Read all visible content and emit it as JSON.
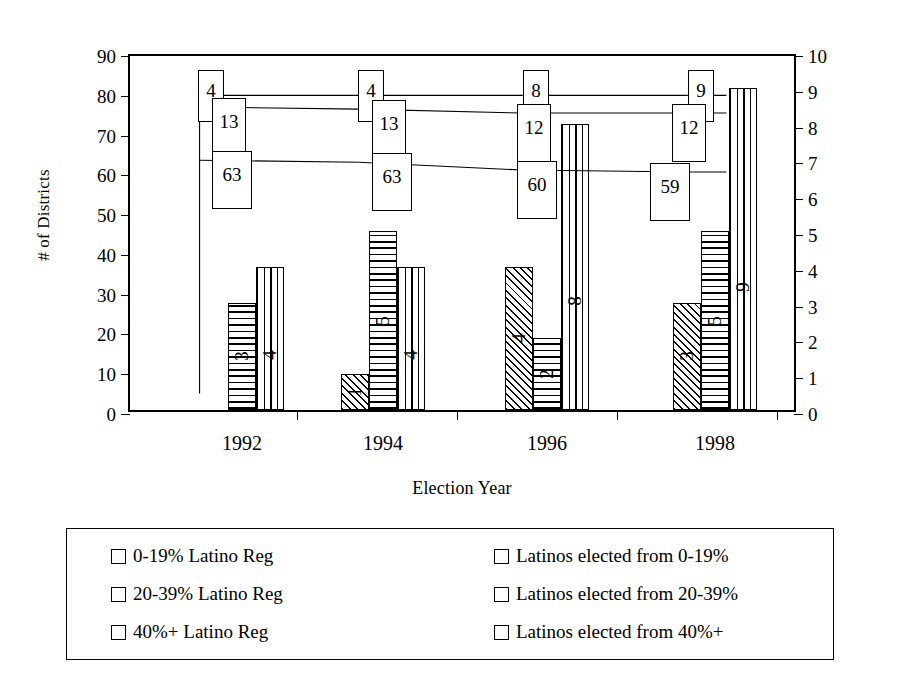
{
  "chart_data": {
    "type": "bar",
    "title": "",
    "subtitle": "",
    "xlabel": "Election Year",
    "ylabel": "# of Districts",
    "y2label": "# of Latino Elected Officials",
    "categories": [
      "1992",
      "1994",
      "1996",
      "1998"
    ],
    "ylim": [
      0,
      90
    ],
    "yticks": [
      0,
      10,
      20,
      30,
      40,
      50,
      60,
      70,
      80,
      90
    ],
    "y2lim": [
      0,
      10
    ],
    "y2ticks": [
      0,
      1,
      2,
      3,
      4,
      5,
      6,
      7,
      8,
      9,
      10
    ],
    "grid": false,
    "legend_position": "bottom",
    "series": [
      {
        "name": "0-19% Latino Reg",
        "kind": "line",
        "axis": "left",
        "pattern": "open",
        "values": [
          4,
          4,
          8,
          9
        ]
      },
      {
        "name": "20-39% Latino Reg",
        "kind": "line",
        "axis": "left",
        "pattern": "open",
        "values": [
          13,
          13,
          12,
          12
        ]
      },
      {
        "name": "40%+ Latino Reg",
        "kind": "line",
        "axis": "left",
        "pattern": "open",
        "values": [
          63,
          63,
          60,
          59
        ]
      },
      {
        "name": "Latinos elected from 0-19%",
        "kind": "bar",
        "axis": "right",
        "pattern": "diagonal-hatch",
        "values": [
          0,
          1,
          4,
          3
        ]
      },
      {
        "name": "Latinos elected from 20-39%",
        "kind": "bar",
        "axis": "right",
        "pattern": "horizontal-hatch",
        "values": [
          3,
          5,
          2,
          5
        ]
      },
      {
        "name": "Latinos elected from 40%+",
        "kind": "bar",
        "axis": "right",
        "pattern": "vertical-hatch",
        "values": [
          4,
          4,
          8,
          9
        ]
      }
    ],
    "line_plot_values": {
      "note": "lines are drawn on the left axis near the top of the plot",
      "series_0_plotted": [
        80,
        80,
        80,
        80
      ],
      "series_1_plotted": [
        77,
        76.5,
        75.5,
        75.5
      ],
      "series_2_plotted": [
        63.5,
        63,
        61,
        60.5
      ]
    }
  },
  "axes": {
    "left": {
      "title": "# of Districts",
      "ticks": [
        "0",
        "10",
        "20",
        "30",
        "40",
        "50",
        "60",
        "70",
        "80",
        "90"
      ]
    },
    "right": {
      "title": "# of Latino Elected Officials",
      "ticks": [
        "0",
        "1",
        "2",
        "3",
        "4",
        "5",
        "6",
        "7",
        "8",
        "9",
        "10"
      ]
    },
    "x": {
      "title": "Election Year",
      "ticks": [
        "1992",
        "1994",
        "1996",
        "1998"
      ]
    }
  },
  "point_labels": {
    "y1992": [
      "4",
      "13",
      "63"
    ],
    "y1994": [
      "4",
      "13",
      "63"
    ],
    "y1996": [
      "8",
      "12",
      "60"
    ],
    "y1998": [
      "9",
      "12",
      "59"
    ]
  },
  "bar_labels": {
    "y1992": [
      "",
      "3",
      "4"
    ],
    "y1994": [
      "1",
      "5",
      "4"
    ],
    "y1996": [
      "4",
      "2",
      "8"
    ],
    "y1998": [
      "3",
      "5",
      "9"
    ]
  },
  "legend": {
    "items": [
      {
        "label": "0-19% Latino Reg",
        "pattern": "open"
      },
      {
        "label": "20-39% Latino Reg",
        "pattern": "open"
      },
      {
        "label": "40%+ Latino Reg",
        "pattern": "open"
      },
      {
        "label": "Latinos elected from 0-19%",
        "pattern": "diagonal-hatch"
      },
      {
        "label": "Latinos elected from 20-39%",
        "pattern": "horizontal-hatch"
      },
      {
        "label": "Latinos elected from 40%+",
        "pattern": "vertical-hatch"
      }
    ]
  },
  "colors": {
    "ink": "#000000",
    "paper": "#ffffff"
  }
}
